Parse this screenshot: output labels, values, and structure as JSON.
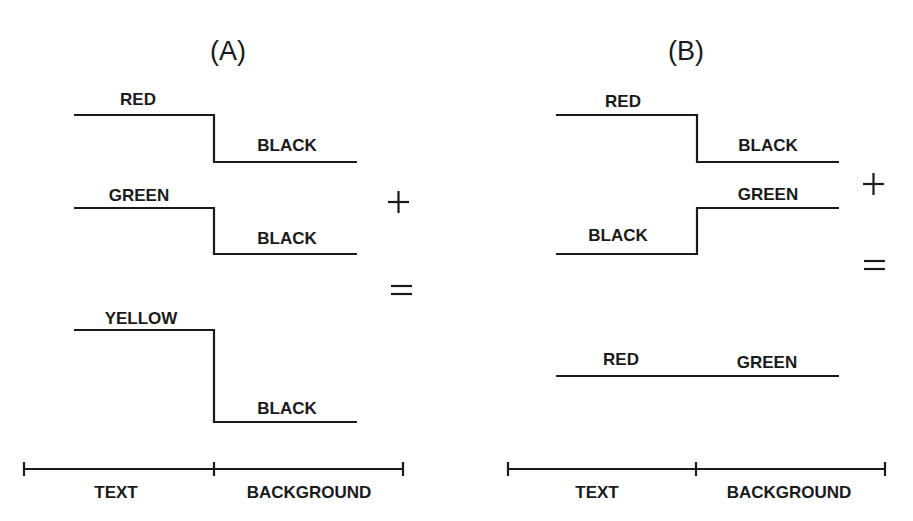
{
  "panels": [
    {
      "title": "(A)",
      "rows": [
        {
          "text_label": "RED",
          "background_label": "BLACK",
          "shape": "step-down"
        },
        {
          "text_label": "GREEN",
          "background_label": "BLACK",
          "shape": "step-down"
        },
        {
          "text_label": "YELLOW",
          "background_label": "BLACK",
          "shape": "step-down-large"
        }
      ],
      "operators": {
        "plus": "+",
        "equals": "="
      },
      "axis": {
        "left_label": "TEXT",
        "right_label": "BACKGROUND"
      }
    },
    {
      "title": "(B)",
      "rows": [
        {
          "text_label": "RED",
          "background_label": "BLACK",
          "shape": "step-down"
        },
        {
          "text_label": "BLACK",
          "background_label": "GREEN",
          "shape": "step-up"
        },
        {
          "text_label": "RED",
          "background_label": "GREEN",
          "shape": "flat"
        }
      ],
      "operators": {
        "plus": "+",
        "equals": "="
      },
      "axis": {
        "left_label": "TEXT",
        "right_label": "BACKGROUND"
      }
    }
  ],
  "colors": {
    "ink": "#1a1a1a",
    "background": "#ffffff"
  }
}
